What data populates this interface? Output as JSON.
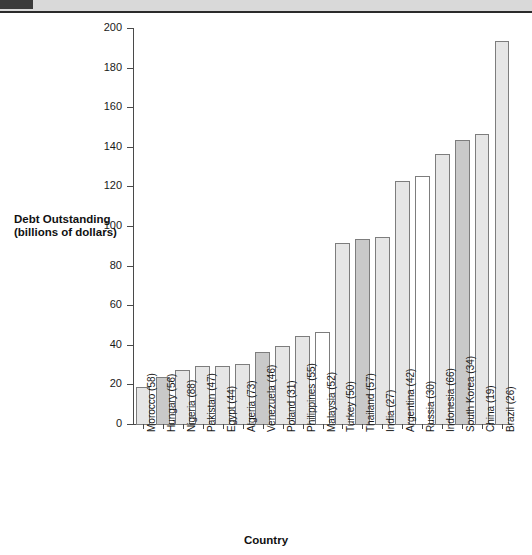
{
  "banner": {
    "tab_label": "",
    "strip_label": ""
  },
  "chart_data": {
    "type": "bar",
    "title": "",
    "xlabel": "Country",
    "ylabel": "Debt Outstanding (billions of dollars)",
    "ylabel_line1": "Debt Outstanding",
    "ylabel_line2": "(billions of dollars)",
    "ylim": [
      0,
      200
    ],
    "ytick_step": 20,
    "ytick_labels": [
      "0",
      "20",
      "40",
      "60",
      "80",
      "100",
      "120",
      "140",
      "160",
      "180",
      "200"
    ],
    "ytick_values": [
      0,
      20,
      40,
      60,
      80,
      100,
      120,
      140,
      160,
      180,
      200
    ],
    "grid": false,
    "legend": "none",
    "categories": [
      "Morocco (58)",
      "Hungary (56)",
      "Nigeria (88)",
      "Pakistan (47)",
      "Egypt (44)",
      "Algeria (73)",
      "Venezuela (46)",
      "Poland (31)",
      "Philippines (55)",
      "Malaysia (52)",
      "Turkey (50)",
      "Thailand (57)",
      "India (27)",
      "Argentina (42)",
      "Russia (30)",
      "Indonesia (66)",
      "South Korea (34)",
      "China (19)",
      "Brazil (26)"
    ],
    "values": [
      19,
      24,
      28,
      30,
      30,
      31,
      37,
      40,
      45,
      47,
      92,
      94,
      95,
      123,
      126,
      137,
      144,
      147,
      194
    ],
    "bar_shades": [
      "light",
      "mid",
      "light",
      "light",
      "light",
      "light",
      "mid",
      "light",
      "light",
      "white",
      "light",
      "mid",
      "light",
      "light",
      "white",
      "light",
      "mid",
      "light",
      "light"
    ],
    "colors": {
      "bar_light": "#e6e6e6",
      "bar_mid": "#c9c9c9",
      "bar_white": "#ffffff",
      "bar_outline": "#7d7d7d",
      "axis": "#4a4a4a",
      "text": "#1a1a1a",
      "banner_strip": "#d9d9d9",
      "banner_tab": "#3a3a3a"
    }
  }
}
